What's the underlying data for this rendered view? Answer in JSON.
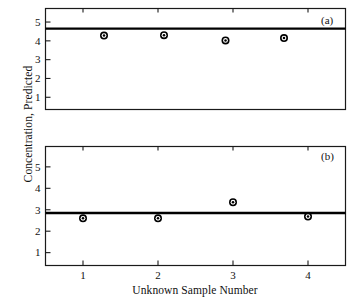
{
  "chart_data": {
    "type": "scatter",
    "title": "",
    "xlabel": "Unknown Sample Number",
    "ylabel": "Concentration, Predicted",
    "grid": false,
    "legend": "none",
    "xlim": [
      0.5,
      4.5
    ],
    "xticks": [
      1,
      2,
      3,
      4
    ],
    "xtick_labels": [
      "1",
      "2",
      "3",
      "4"
    ],
    "panels": [
      {
        "tag": "(a)",
        "ylim": [
          0.35,
          5.72
        ],
        "yticks": [
          1,
          2,
          3,
          4,
          5
        ],
        "ytick_labels": [
          "1",
          "2",
          "3",
          "4",
          "5"
        ],
        "reference_line": 4.65,
        "marker": "open-circle-filled-ring",
        "x": [
          1.28,
          2.08,
          2.9,
          3.68
        ],
        "y": [
          4.28,
          4.3,
          4.02,
          4.15
        ]
      },
      {
        "tag": "(b)",
        "ylim": [
          0.4,
          5.95
        ],
        "yticks": [
          1,
          2,
          3,
          4,
          5
        ],
        "ytick_labels": [
          "1",
          "2",
          "3",
          "4",
          "5"
        ],
        "reference_line": 2.85,
        "marker": "open-circle-filled-ring",
        "x": [
          1.0,
          2.0,
          3.0,
          4.0
        ],
        "y": [
          2.6,
          2.6,
          3.35,
          2.68
        ]
      }
    ]
  },
  "axes": {
    "y_axis_label": "Concentration, Predicted",
    "x_axis_label": "Unknown Sample Number"
  },
  "panel_a": {
    "tag": "(a)",
    "ytick_1": "1",
    "ytick_2": "2",
    "ytick_3": "3",
    "ytick_4": "4",
    "ytick_5": "5"
  },
  "panel_b": {
    "tag": "(b)",
    "ytick_1": "1",
    "ytick_2": "2",
    "ytick_3": "3",
    "ytick_4": "4",
    "ytick_5": "5"
  },
  "xticks": {
    "t1": "1",
    "t2": "2",
    "t3": "3",
    "t4": "4"
  },
  "colors": {
    "axis": "#1a1a1a",
    "marker": "#000000",
    "marker_inner": "#ffffff",
    "line": "#000000",
    "background": "#ffffff"
  }
}
